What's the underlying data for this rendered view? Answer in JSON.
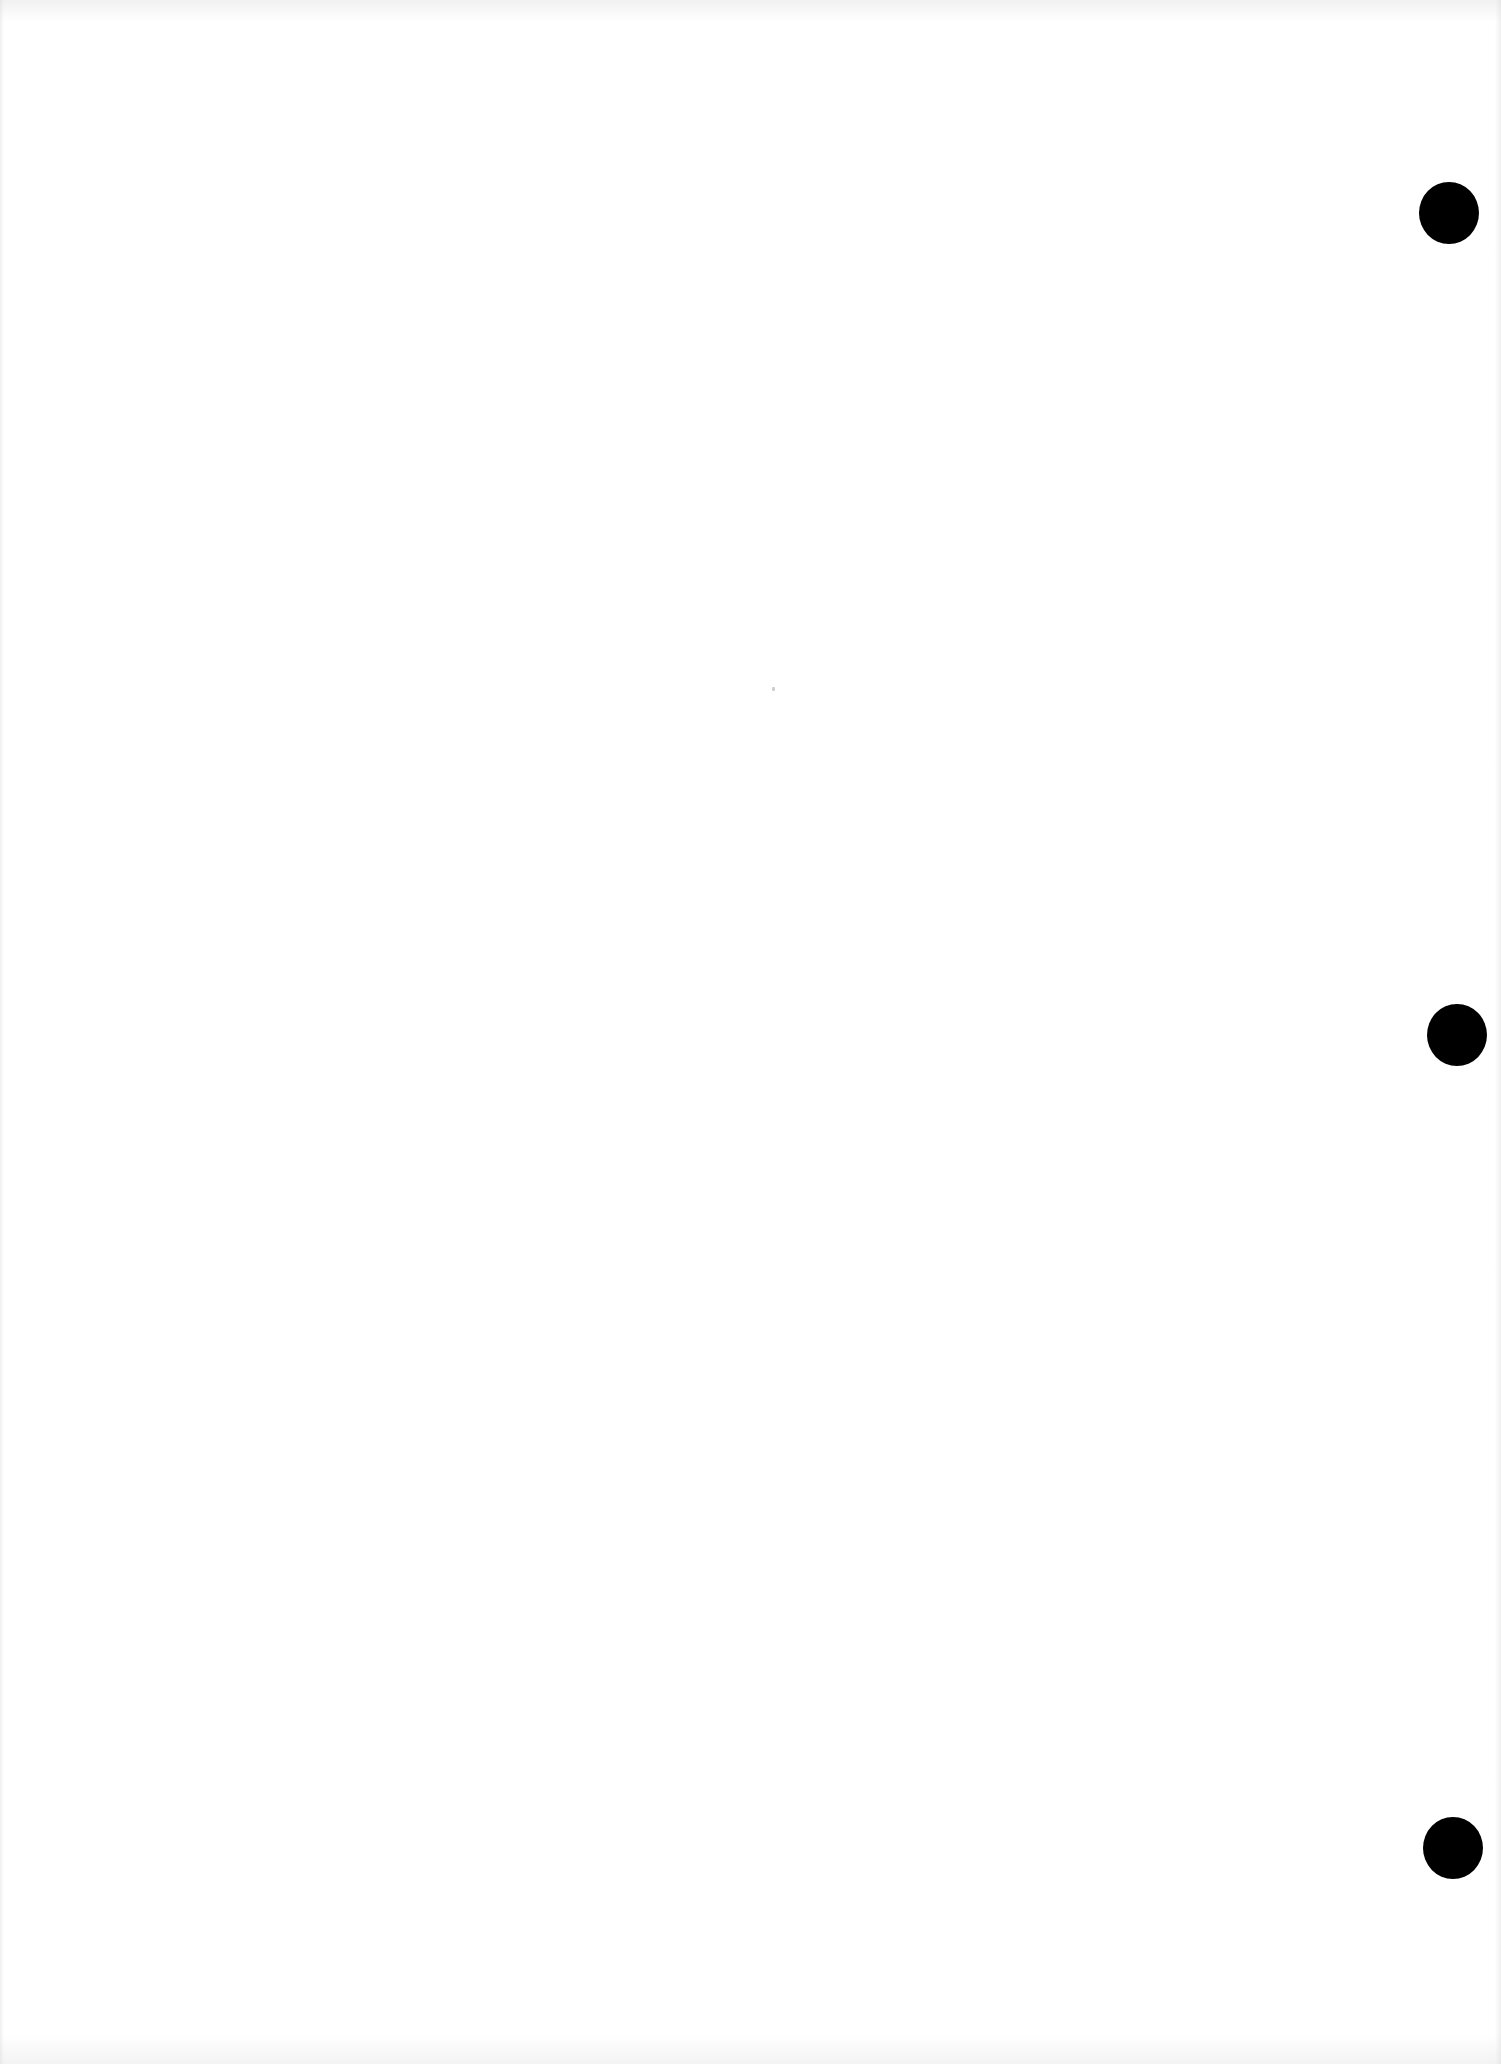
{
  "page": {
    "type": "blank scanned sheet",
    "background_color": "#ffffff",
    "text": ""
  },
  "punch_holes": [
    {
      "label": "top",
      "cx": 1449,
      "cy": 213,
      "color": "#000000"
    },
    {
      "label": "middle",
      "cx": 1457,
      "cy": 1035,
      "color": "#000000"
    },
    {
      "label": "bottom",
      "cx": 1453,
      "cy": 1848,
      "color": "#000000"
    }
  ]
}
